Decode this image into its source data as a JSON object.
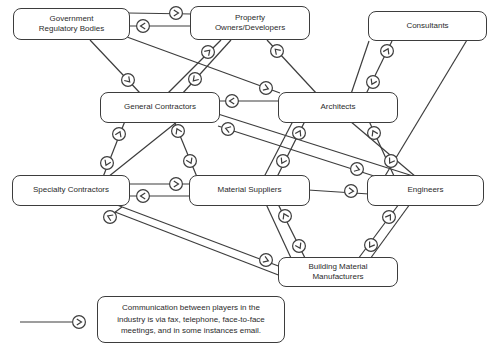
{
  "style": {
    "stroke_color": "#3d3d3d",
    "background": "#ffffff",
    "text_color": "#2b2b2b",
    "arrow_glyph": ">"
  },
  "legend": {
    "text": "Communication between players in the\nindustry is via fax, telephone, face-to-face\nmeetings, and in some instances email.",
    "box": [
      97,
      296,
      188,
      47
    ],
    "line": [
      20,
      322,
      72,
      322
    ],
    "arrow": [
      79,
      322,
      0
    ]
  },
  "nodes": [
    {
      "id": "government-regulatory-bodies",
      "label": "Government\nRegulatory Bodies",
      "x": 13,
      "y": 8,
      "w": 117,
      "h": 32
    },
    {
      "id": "property-owners-developers",
      "label": "Property\nOwners/Developers",
      "x": 190,
      "y": 6,
      "w": 120,
      "h": 34
    },
    {
      "id": "consultants",
      "label": "Consultants",
      "x": 368,
      "y": 11,
      "w": 119,
      "h": 30
    },
    {
      "id": "general-contractors",
      "label": "General Contractors",
      "x": 100,
      "y": 92,
      "w": 120,
      "h": 31
    },
    {
      "id": "architects",
      "label": "Architects",
      "x": 278,
      "y": 92,
      "w": 120,
      "h": 31
    },
    {
      "id": "specialty-contractors",
      "label": "Specialty Contractors",
      "x": 12,
      "y": 175,
      "w": 118,
      "h": 31
    },
    {
      "id": "material-suppliers",
      "label": "Material Suppliers",
      "x": 189,
      "y": 175,
      "w": 121,
      "h": 31
    },
    {
      "id": "engineers",
      "label": "Engineers",
      "x": 367,
      "y": 175,
      "w": 117,
      "h": 31
    },
    {
      "id": "building-material-manufacturers",
      "label": "Building Material\nManufacturers",
      "x": 278,
      "y": 257,
      "w": 120,
      "h": 30
    }
  ],
  "edges": [
    [
      128,
      13,
      192,
      14
    ],
    [
      192,
      26,
      128,
      26
    ],
    [
      90,
      40,
      140,
      93
    ],
    [
      127,
      37,
      280,
      93
    ],
    [
      167,
      94,
      221,
      40
    ],
    [
      231,
      40,
      182,
      94
    ],
    [
      317,
      94,
      267,
      40
    ],
    [
      392,
      41,
      366,
      94
    ],
    [
      369,
      41,
      351,
      94
    ],
    [
      280,
      101,
      218,
      101
    ],
    [
      125,
      121,
      103,
      177
    ],
    [
      178,
      121,
      108,
      177
    ],
    [
      174,
      121,
      197,
      177
    ],
    [
      128,
      184,
      192,
      184
    ],
    [
      192,
      196,
      128,
      196
    ],
    [
      218,
      126,
      374,
      176
    ],
    [
      218,
      114,
      413,
      176
    ],
    [
      305,
      121,
      277,
      177
    ],
    [
      293,
      121,
      264,
      177
    ],
    [
      394,
      176,
      369,
      121
    ],
    [
      350,
      121,
      416,
      177
    ],
    [
      467,
      40,
      385,
      176
    ],
    [
      308,
      190,
      369,
      194
    ],
    [
      278,
      204,
      305,
      258
    ],
    [
      266,
      204,
      291,
      258
    ],
    [
      399,
      204,
      358,
      259
    ],
    [
      410,
      204,
      370,
      259
    ],
    [
      117,
      205,
      281,
      267
    ],
    [
      281,
      276,
      115,
      212
    ],
    [
      122,
      207,
      110,
      216
    ],
    [
      20,
      322,
      72,
      322
    ]
  ],
  "arrows": [
    [
      176,
      13,
      0
    ],
    [
      143,
      26,
      180
    ],
    [
      128,
      80,
      47
    ],
    [
      266,
      88,
      20
    ],
    [
      208,
      52,
      -45
    ],
    [
      195,
      79,
      133
    ],
    [
      277,
      51,
      -134
    ],
    [
      387,
      51,
      -64
    ],
    [
      373,
      82,
      116
    ],
    [
      232,
      101,
      180
    ],
    [
      119,
      134,
      -66
    ],
    [
      107,
      163,
      114
    ],
    [
      178,
      131,
      -115
    ],
    [
      190,
      161,
      65
    ],
    [
      176,
      184,
      0
    ],
    [
      143,
      196,
      180
    ],
    [
      228,
      129,
      -162
    ],
    [
      357,
      169,
      18
    ],
    [
      299,
      133,
      -62
    ],
    [
      283,
      161,
      118
    ],
    [
      374,
      133,
      -116
    ],
    [
      391,
      161,
      122
    ],
    [
      351,
      191,
      4
    ],
    [
      285,
      216,
      -116
    ],
    [
      299,
      246,
      63
    ],
    [
      389,
      217,
      -57
    ],
    [
      371,
      245,
      123
    ],
    [
      266,
      260,
      21
    ],
    [
      110,
      217,
      -157
    ],
    [
      79,
      322,
      0
    ]
  ]
}
